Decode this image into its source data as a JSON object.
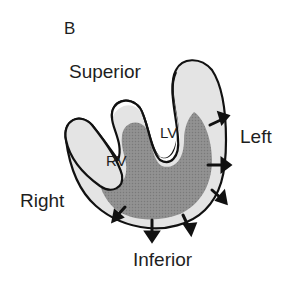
{
  "figure": {
    "panel_label": "B",
    "directions": {
      "superior": "Superior",
      "left": "Left",
      "right": "Right",
      "inferior": "Inferior"
    },
    "chambers": {
      "lv": "LV",
      "rv": "RV"
    },
    "colors": {
      "outline": "#111111",
      "wall_light": "#e4e4e4",
      "myocardium_dark": "#8c8c8c",
      "cavity": "#ffffff",
      "text": "#1e1e1e"
    }
  }
}
